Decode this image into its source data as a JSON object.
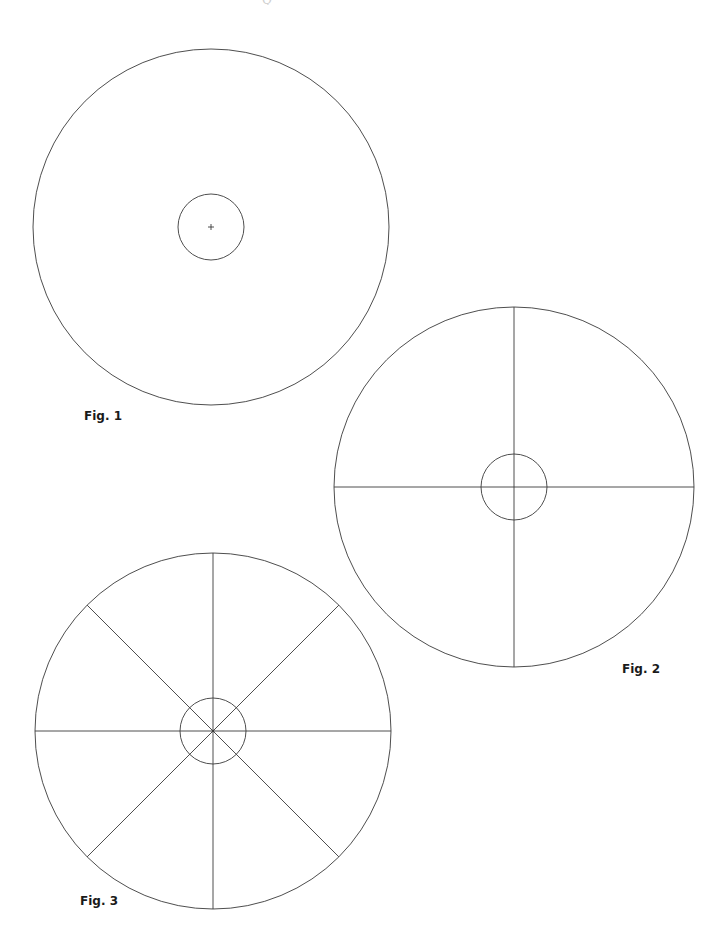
{
  "page": {
    "header_partial": "Q · · · · · · · · · · · ·"
  },
  "figures": [
    {
      "label": "Fig. 1",
      "cx": 211,
      "cy": 227,
      "outer_r": 178,
      "inner_r": 33,
      "spokes": 0,
      "center_mark": "plus",
      "label_pos": {
        "x": 84,
        "y": 409
      }
    },
    {
      "label": "Fig. 2",
      "cx": 514,
      "cy": 487,
      "outer_r": 180,
      "inner_r": 33,
      "spokes": 4,
      "center_mark": "none",
      "label_pos": {
        "x": 622,
        "y": 662
      }
    },
    {
      "label": "Fig. 3",
      "cx": 213,
      "cy": 731,
      "outer_r": 178,
      "inner_r": 33,
      "spokes": 8,
      "center_mark": "dot",
      "label_pos": {
        "x": 80,
        "y": 894
      }
    }
  ],
  "colors": {
    "stroke": "#3a3a3a",
    "background": "#ffffff"
  }
}
